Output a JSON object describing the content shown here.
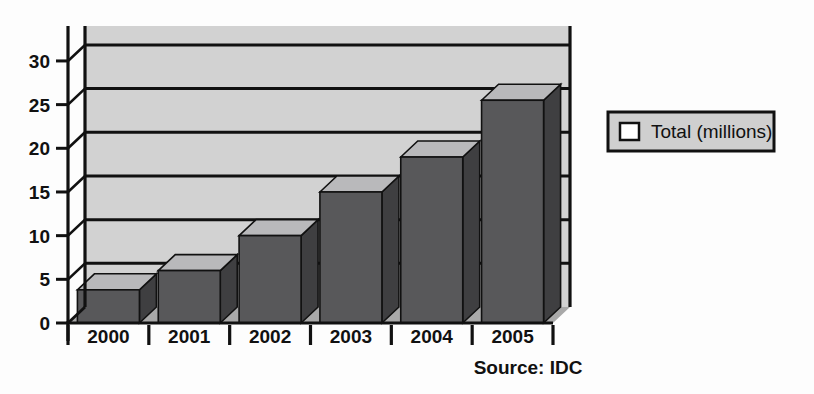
{
  "chart_data": {
    "type": "bar",
    "title": "",
    "subtitle": "",
    "xlabel": "",
    "ylabel": "",
    "categories": [
      "2000",
      "2001",
      "2002",
      "2003",
      "2004",
      "2005"
    ],
    "series": [
      {
        "name": "Total (millions)",
        "values": [
          3.8,
          6,
          10,
          15,
          19,
          25.5
        ]
      }
    ],
    "yticks": [
      "0",
      "5",
      "10",
      "15",
      "20",
      "25",
      "30"
    ],
    "ytick_values": [
      0,
      5,
      10,
      15,
      20,
      25,
      30
    ],
    "ylim": [
      0,
      34
    ],
    "grid": true,
    "grid_axis": "y",
    "legend": {
      "position": "right",
      "entries": [
        {
          "label": "Total (millions)",
          "swatch_color": "#ffffff"
        }
      ]
    },
    "style": "3d-bar",
    "annotations": [
      {
        "name": "source-note",
        "text": "Source: IDC"
      }
    ]
  },
  "colors": {
    "bar_front": "#58585a",
    "bar_top": "#b9b9bb",
    "bar_side": "#3f3f41",
    "back_wall": "#d2d2d2",
    "floor": "#a9a9a9",
    "axis": "#111111",
    "legend_fill": "#cfcfcf",
    "page_background": "#fdfdfd"
  },
  "legend_box": {
    "swatch_name": "legend-swatch-total",
    "label": "Total (millions)"
  },
  "source": {
    "text": "Source: IDC"
  }
}
